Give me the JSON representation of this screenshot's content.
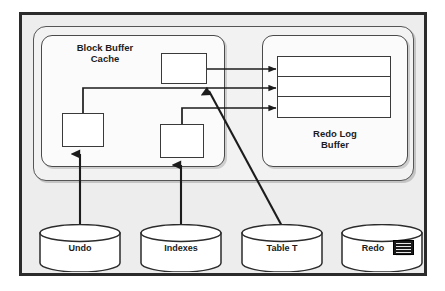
{
  "figure": {
    "background_color": "#ededed",
    "frame_color": "#2b2b2b"
  },
  "sga": {
    "name": "SGA container"
  },
  "block_buffer_cache": {
    "label": "Block Buffer\nCache",
    "blocks": [
      {
        "id": "blk-top",
        "label": ""
      },
      {
        "id": "blk-left",
        "label": ""
      },
      {
        "id": "blk-mid",
        "label": ""
      }
    ]
  },
  "redo_log_buffer": {
    "label": "Redo Log\nBuffer",
    "rows": [
      {
        "label": ""
      },
      {
        "label": ""
      },
      {
        "label": ""
      }
    ]
  },
  "datafiles": [
    {
      "id": "cyl-undo",
      "label": "Undo",
      "icon": ""
    },
    {
      "id": "cyl-indexes",
      "label": "Indexes",
      "icon": ""
    },
    {
      "id": "cyl-table",
      "label": "Table T",
      "icon": ""
    },
    {
      "id": "cyl-redo",
      "label": "Redo",
      "icon": "redo-log-stripes-icon"
    }
  ],
  "connectors": [
    {
      "from": "blk-top",
      "to": "redo-log-buffer-row-1",
      "style": "orthogonal-arrow"
    },
    {
      "from": "blk-left",
      "to": "redo-log-buffer-row-2",
      "style": "orthogonal-arrow"
    },
    {
      "from": "blk-mid",
      "to": "redo-log-buffer-row-3",
      "style": "orthogonal-arrow"
    },
    {
      "from": "cyl-undo",
      "to": "blk-left",
      "style": "vertical-arrow"
    },
    {
      "from": "cyl-indexes",
      "to": "blk-mid",
      "style": "vertical-arrow"
    },
    {
      "from": "cyl-table",
      "to": "block-buffer-cache",
      "style": "diagonal-arrow"
    }
  ]
}
